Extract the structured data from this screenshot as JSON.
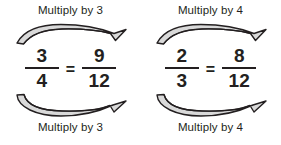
{
  "diagram": {
    "colors": {
      "text": "#231f20",
      "arrow_outline": "#231f20",
      "arrow_fill": "#d9d9d9",
      "background": "#ffffff"
    },
    "groups": [
      {
        "id": "left",
        "top_caption": "Multiply by 3",
        "bottom_caption": "Multiply by 3",
        "factor": "3",
        "left_fraction": {
          "numerator": "3",
          "denominator": "4"
        },
        "relation": "=",
        "right_fraction": {
          "numerator": "9",
          "denominator": "12"
        },
        "top_arrow_name": "numerator-multiply-arrow",
        "bottom_arrow_name": "denominator-multiply-arrow"
      },
      {
        "id": "right",
        "top_caption": "Multiply by 4",
        "bottom_caption": "Multiply by 4",
        "factor": "4",
        "left_fraction": {
          "numerator": "2",
          "denominator": "3"
        },
        "relation": "=",
        "right_fraction": {
          "numerator": "8",
          "denominator": "12"
        },
        "top_arrow_name": "numerator-multiply-arrow",
        "bottom_arrow_name": "denominator-multiply-arrow"
      }
    ]
  }
}
